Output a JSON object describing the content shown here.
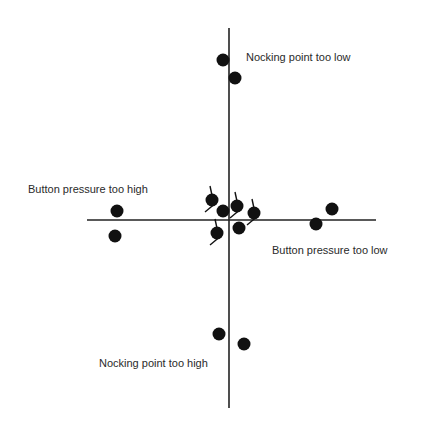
{
  "diagram": {
    "labels": {
      "top": "Nocking point too low",
      "bottom": "Nocking point too high",
      "left": "Button pressure too high",
      "right": "Button pressure too low"
    },
    "axes": {
      "vertical": {
        "x": 229,
        "y1": 28,
        "y2": 408
      },
      "horizontal": {
        "y": 220,
        "x1": 87,
        "x2": 376
      }
    },
    "points": [
      {
        "group": "top",
        "x": 223,
        "y": 60,
        "fletched": false
      },
      {
        "group": "top",
        "x": 235,
        "y": 78,
        "fletched": false
      },
      {
        "group": "left",
        "x": 117,
        "y": 211,
        "fletched": false
      },
      {
        "group": "left",
        "x": 115,
        "y": 236,
        "fletched": false
      },
      {
        "group": "right",
        "x": 316,
        "y": 224,
        "fletched": false
      },
      {
        "group": "right",
        "x": 332,
        "y": 209,
        "fletched": false
      },
      {
        "group": "center",
        "x": 212,
        "y": 200,
        "fletched": true
      },
      {
        "group": "center",
        "x": 223,
        "y": 211,
        "fletched": false
      },
      {
        "group": "center",
        "x": 237,
        "y": 206,
        "fletched": true
      },
      {
        "group": "center",
        "x": 254,
        "y": 213,
        "fletched": true
      },
      {
        "group": "center",
        "x": 217,
        "y": 233,
        "fletched": true
      },
      {
        "group": "center",
        "x": 239,
        "y": 228,
        "fletched": false
      },
      {
        "group": "bottom",
        "x": 219,
        "y": 334,
        "fletched": false
      },
      {
        "group": "bottom",
        "x": 244,
        "y": 344,
        "fletched": false
      }
    ],
    "colors": {
      "ink": "#111111",
      "text": "#2a2a2a",
      "background": "#ffffff"
    }
  }
}
